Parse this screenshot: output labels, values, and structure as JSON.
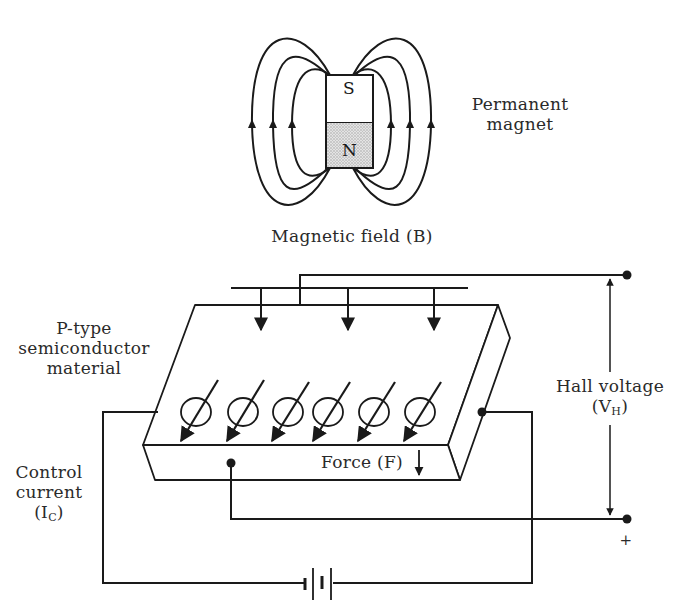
{
  "diagram": {
    "magnet": {
      "label_line1": "Permanent",
      "label_line2": "magnet",
      "south_pole": "S",
      "north_pole": "N"
    },
    "magnetic_field": {
      "label": "Magnetic field (B)",
      "arrow_count": 3
    },
    "semiconductor": {
      "label_line1": "P-type",
      "label_line2": "semiconductor",
      "label_line3": "material",
      "carrier_count": 6
    },
    "force": {
      "label": "Force (F)"
    },
    "hall_voltage": {
      "label_line1": "Hall voltage",
      "label_open": "(V",
      "label_sub": "H",
      "label_close": ")",
      "polarity": "+"
    },
    "control_current": {
      "label_line1": "Control",
      "label_line2": "current",
      "label_open": "(I",
      "label_sub": "C",
      "label_close": ")"
    },
    "battery": {
      "symbol": "battery-icon"
    },
    "colors": {
      "line": "#1a1a1a",
      "text": "#2a2a2a",
      "north_fill": "#cfcfcf",
      "background": "#ffffff"
    }
  }
}
